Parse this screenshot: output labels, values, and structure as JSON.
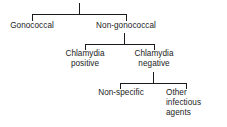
{
  "diagram": {
    "type": "classification-tree",
    "title": "",
    "background_color": "#ffffff",
    "line_color": "#1b1b1b",
    "text_color": "#1b1b1b",
    "nodes": [
      {
        "id": "gonococcal",
        "label": "Gonococcal",
        "level": 1
      },
      {
        "id": "non-gonococcal",
        "label": "Non-gonococcal",
        "level": 1
      },
      {
        "id": "chlamydia-positive",
        "label": "Chlamydia\npositive",
        "level": 2
      },
      {
        "id": "chlamydia-negative",
        "label": "Chlamydia\nnegative",
        "level": 2
      },
      {
        "id": "non-specific",
        "label": "Non-specific",
        "level": 3
      },
      {
        "id": "other-infectious",
        "label": "Other\ninfectious\nagents",
        "level": 3
      }
    ],
    "branches": [
      {
        "id": "branch-root",
        "parent": "root",
        "children": [
          "gonococcal",
          "non-gonococcal"
        ]
      },
      {
        "id": "branch-non-gonococcal",
        "parent": "non-gonococcal",
        "children": [
          "chlamydia-positive",
          "chlamydia-negative"
        ]
      },
      {
        "id": "branch-chlamydia-negative",
        "parent": "chlamydia-negative",
        "children": [
          "non-specific",
          "other-infectious"
        ]
      }
    ]
  }
}
